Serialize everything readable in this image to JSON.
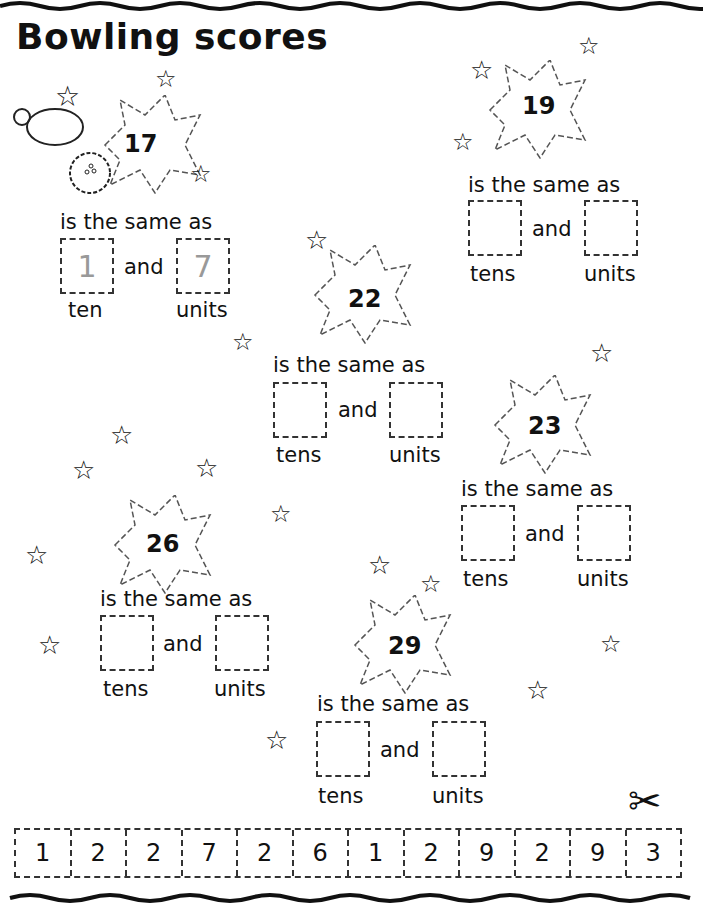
{
  "title": "Bowling scores",
  "same_text": "is the same as",
  "and_text": "and",
  "problems": [
    {
      "score": "17",
      "tens_value": "1",
      "units_value": "7",
      "tens_label": "ten",
      "units_label": "units"
    },
    {
      "score": "19",
      "tens_value": "",
      "units_value": "",
      "tens_label": "tens",
      "units_label": "units"
    },
    {
      "score": "22",
      "tens_value": "",
      "units_value": "",
      "tens_label": "tens",
      "units_label": "units"
    },
    {
      "score": "23",
      "tens_value": "",
      "units_value": "",
      "tens_label": "tens",
      "units_label": "units"
    },
    {
      "score": "26",
      "tens_value": "",
      "units_value": "",
      "tens_label": "tens",
      "units_label": "units"
    },
    {
      "score": "29",
      "tens_value": "",
      "units_value": "",
      "tens_label": "tens",
      "units_label": "units"
    }
  ],
  "cutout_strip": [
    "1",
    "2",
    "2",
    "7",
    "2",
    "6",
    "1",
    "2",
    "9",
    "2",
    "9",
    "3"
  ],
  "icons": {
    "scissors": "scissors-icon",
    "star": "star-icon",
    "pin": "bowling-pin-icon",
    "ball": "bowling-ball-icon"
  }
}
